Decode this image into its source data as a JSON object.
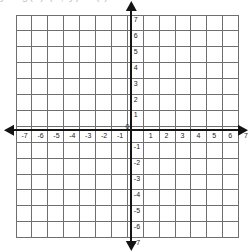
{
  "page": {
    "background_color": "#ffffff",
    "cropped_header_text": "y = g(x)      (2, y) = ( )"
  },
  "chart_data": {
    "type": "scatter",
    "title": "",
    "subtitle": "",
    "xlabel": "",
    "ylabel": "",
    "xlim": [
      -7,
      7
    ],
    "ylim": [
      -7,
      7
    ],
    "grid": true,
    "grid_step": 1,
    "legend": null,
    "legend_position": "none",
    "series": [],
    "x_tick_labels": [
      "-7",
      "-6",
      "-5",
      "-4",
      "-3",
      "-2",
      "-1",
      "0",
      "1",
      "2",
      "3",
      "4",
      "5",
      "6",
      "7"
    ],
    "y_tick_labels": [
      "-7",
      "-6",
      "-5",
      "-4",
      "-3",
      "-2",
      "-1",
      "0",
      "1",
      "2",
      "3",
      "4",
      "5",
      "6",
      "7"
    ],
    "origin_label": "0",
    "axes": {
      "x_axis_arrows": [
        "left",
        "right"
      ],
      "y_axis_arrows": [
        "up",
        "down"
      ],
      "axis_color": "#141414",
      "grid_color": "#6f6f6f"
    },
    "annotations": []
  },
  "geometry": {
    "grid_left": 16,
    "grid_top": 15,
    "cell": 15.9,
    "cells_x": 14,
    "cells_y": 14,
    "origin_x": 131.3,
    "origin_y": 130.3
  }
}
